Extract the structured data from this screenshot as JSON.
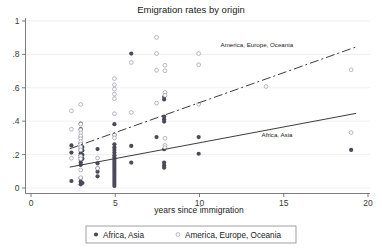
{
  "chart_data": {
    "type": "scatter",
    "title": "Emigration rates by origin",
    "xlabel": "years since immigration",
    "ylabel": "",
    "xlim": [
      0,
      20
    ],
    "ylim": [
      0,
      1
    ],
    "xticks": [
      0,
      5,
      10,
      15,
      20
    ],
    "xticklabels": [
      "0",
      "5",
      "10",
      "15",
      "20"
    ],
    "yticks": [
      0,
      0.2,
      0.4,
      0.6,
      0.8,
      1
    ],
    "yticklabels": [
      "0",
      ".2",
      ".4",
      ".6",
      ".8",
      "1"
    ],
    "grid": "horizontal",
    "legend_position": "bottom-outside",
    "series": [
      {
        "name": "Africa, Asia",
        "marker": "filled-circle",
        "color": "#4a4a58",
        "annotation": "Africa, Asia",
        "annotation_x": 14.6,
        "annotation_y": 0.305,
        "fit_line": {
          "style": "solid",
          "x0": 2.3,
          "y0": 0.125,
          "x1": 19.3,
          "y1": 0.447
        },
        "points": [
          [
            2.4,
            0.255
          ],
          [
            2.4,
            0.212
          ],
          [
            2.4,
            0.042
          ],
          [
            2.95,
            0.385
          ],
          [
            2.95,
            0.352
          ],
          [
            2.95,
            0.305
          ],
          [
            2.95,
            0.268
          ],
          [
            2.95,
            0.247
          ],
          [
            2.95,
            0.235
          ],
          [
            2.95,
            0.222
          ],
          [
            2.95,
            0.208
          ],
          [
            2.95,
            0.196
          ],
          [
            2.95,
            0.182
          ],
          [
            2.95,
            0.168
          ],
          [
            2.95,
            0.152
          ],
          [
            2.95,
            0.138
          ],
          [
            2.95,
            0.06
          ],
          [
            2.95,
            0.038
          ],
          [
            2.95,
            0.022
          ],
          [
            3.05,
            0.245
          ],
          [
            3.05,
            0.225
          ],
          [
            3.05,
            0.198
          ],
          [
            3.05,
            0.175
          ],
          [
            3.05,
            0.03
          ],
          [
            3.95,
            0.233
          ],
          [
            3.95,
            0.148
          ],
          [
            3.95,
            0.118
          ],
          [
            3.95,
            0.098
          ],
          [
            3.95,
            0.07
          ],
          [
            4.95,
            0.382
          ],
          [
            4.95,
            0.318
          ],
          [
            4.95,
            0.262
          ],
          [
            4.95,
            0.243
          ],
          [
            4.95,
            0.228
          ],
          [
            4.95,
            0.212
          ],
          [
            4.95,
            0.196
          ],
          [
            4.95,
            0.182
          ],
          [
            4.95,
            0.168
          ],
          [
            4.95,
            0.156
          ],
          [
            4.95,
            0.144
          ],
          [
            4.95,
            0.132
          ],
          [
            4.95,
            0.12
          ],
          [
            4.95,
            0.108
          ],
          [
            4.95,
            0.096
          ],
          [
            4.95,
            0.084
          ],
          [
            4.95,
            0.072
          ],
          [
            4.95,
            0.06
          ],
          [
            4.95,
            0.048
          ],
          [
            4.95,
            0.036
          ],
          [
            4.95,
            0.024
          ],
          [
            4.95,
            0.012
          ],
          [
            5.95,
            0.805
          ],
          [
            5.95,
            0.252
          ],
          [
            5.95,
            0.152
          ],
          [
            7.9,
            0.545
          ],
          [
            7.9,
            0.53
          ],
          [
            7.9,
            0.428
          ],
          [
            7.9,
            0.412
          ],
          [
            7.9,
            0.398
          ],
          [
            7.9,
            0.232
          ],
          [
            7.9,
            0.152
          ],
          [
            7.9,
            0.135
          ],
          [
            7.9,
            0.122
          ],
          [
            7.45,
            0.305
          ],
          [
            9.95,
            0.305
          ],
          [
            9.95,
            0.205
          ],
          [
            19.0,
            0.228
          ]
        ]
      },
      {
        "name": "America, Europe, Oceania",
        "marker": "open-circle",
        "color": "#9a9aa8",
        "annotation": "America, Europe, Oceania",
        "annotation_x": 13.4,
        "annotation_y": 0.845,
        "fit_line": {
          "style": "dashed",
          "x0": 2.3,
          "y0": 0.235,
          "x1": 19.3,
          "y1": 0.845
        },
        "points": [
          [
            2.4,
            0.462
          ],
          [
            2.4,
            0.352
          ],
          [
            2.4,
            0.178
          ],
          [
            2.95,
            0.5
          ],
          [
            2.95,
            0.382
          ],
          [
            2.95,
            0.348
          ],
          [
            2.95,
            0.33
          ],
          [
            2.95,
            0.312
          ],
          [
            2.95,
            0.295
          ],
          [
            2.95,
            0.278
          ],
          [
            2.95,
            0.262
          ],
          [
            2.95,
            0.245
          ],
          [
            2.95,
            0.228
          ],
          [
            2.95,
            0.19
          ],
          [
            2.95,
            0.175
          ],
          [
            2.95,
            0.108
          ],
          [
            2.95,
            0.062
          ],
          [
            3.95,
            0.18
          ],
          [
            3.95,
            0.118
          ],
          [
            4.95,
            0.655
          ],
          [
            4.95,
            0.618
          ],
          [
            4.95,
            0.592
          ],
          [
            4.95,
            0.562
          ],
          [
            4.95,
            0.535
          ],
          [
            4.95,
            0.445
          ],
          [
            4.95,
            0.318
          ],
          [
            4.95,
            0.3
          ],
          [
            5.95,
            0.752
          ],
          [
            5.95,
            0.452
          ],
          [
            7.45,
            0.902
          ],
          [
            7.45,
            0.805
          ],
          [
            7.45,
            0.705
          ],
          [
            7.45,
            0.508
          ],
          [
            7.95,
            0.735
          ],
          [
            7.95,
            0.702
          ],
          [
            7.95,
            0.572
          ],
          [
            7.95,
            0.555
          ],
          [
            7.95,
            0.298
          ],
          [
            7.95,
            0.255
          ],
          [
            7.95,
            0.242
          ],
          [
            9.95,
            0.805
          ],
          [
            9.95,
            0.738
          ],
          [
            9.95,
            0.502
          ],
          [
            13.95,
            0.608
          ],
          [
            19.0,
            0.708
          ],
          [
            19.0,
            0.332
          ]
        ]
      }
    ]
  },
  "legend": {
    "entries": [
      {
        "label": "Africa, Asia",
        "marker": "filled-circle"
      },
      {
        "label": "America, Europe, Oceania",
        "marker": "open-circle"
      }
    ]
  }
}
